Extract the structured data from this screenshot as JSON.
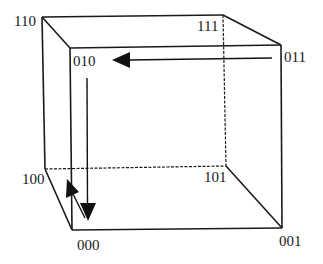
{
  "diagram": {
    "type": "hypercube-3d",
    "vertices": [
      {
        "id": "110",
        "label": "110",
        "x": 42,
        "y": 17
      },
      {
        "id": "111",
        "label": "111",
        "x": 223,
        "y": 15
      },
      {
        "id": "010",
        "label": "010",
        "x": 70,
        "y": 48
      },
      {
        "id": "011",
        "label": "011",
        "x": 281,
        "y": 45
      },
      {
        "id": "100",
        "label": "100",
        "x": 45,
        "y": 169
      },
      {
        "id": "101",
        "label": "101",
        "x": 226,
        "y": 166
      },
      {
        "id": "000",
        "label": "000",
        "x": 72,
        "y": 230
      },
      {
        "id": "001",
        "label": "001",
        "x": 282,
        "y": 228
      }
    ],
    "labels": {
      "v110": "110",
      "v111": "111",
      "v010": "010",
      "v011": "011",
      "v100": "100",
      "v101": "101",
      "v000": "000",
      "v001": "001"
    },
    "edges": [
      {
        "from": "110",
        "to": "111",
        "style": "solid"
      },
      {
        "from": "110",
        "to": "010",
        "style": "solid"
      },
      {
        "from": "111",
        "to": "011",
        "style": "solid"
      },
      {
        "from": "010",
        "to": "011",
        "style": "solid"
      },
      {
        "from": "110",
        "to": "100",
        "style": "solid"
      },
      {
        "from": "010",
        "to": "000",
        "style": "solid"
      },
      {
        "from": "011",
        "to": "001",
        "style": "solid"
      },
      {
        "from": "111",
        "to": "101",
        "style": "dashed"
      },
      {
        "from": "100",
        "to": "101",
        "style": "dashed"
      },
      {
        "from": "100",
        "to": "000",
        "style": "solid"
      },
      {
        "from": "000",
        "to": "001",
        "style": "solid"
      },
      {
        "from": "101",
        "to": "001",
        "style": "solid"
      }
    ],
    "arrows": [
      {
        "from": "011",
        "to": "010",
        "direction": "left"
      },
      {
        "from": "010",
        "to": "000",
        "direction": "down"
      },
      {
        "from": "000",
        "to": "100",
        "direction": "up-left"
      }
    ],
    "colors": {
      "line": "#1a1a1a",
      "background": "#ffffff"
    }
  }
}
